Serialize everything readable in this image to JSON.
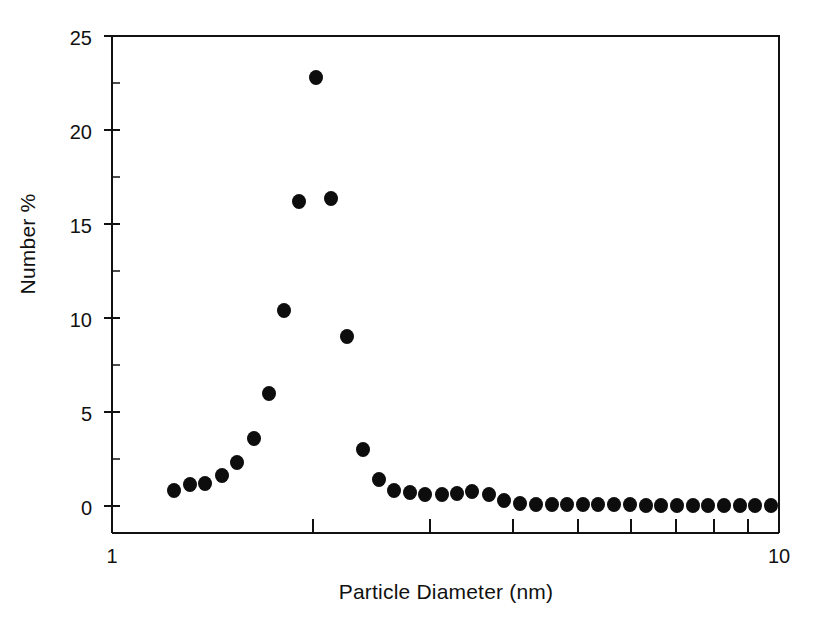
{
  "chart_data": {
    "type": "scatter",
    "title": "",
    "xlabel": "Particle Diameter (nm)",
    "ylabel": "Number %",
    "xscale": "log",
    "yscale": "linear",
    "xlim": [
      1,
      10
    ],
    "ylim": [
      0,
      25
    ],
    "xticks": [
      1,
      10
    ],
    "xtick_labels": [
      "1",
      "10"
    ],
    "yticks": [
      0,
      5,
      10,
      15,
      20,
      25
    ],
    "ytick_labels": [
      "0",
      "5",
      "10",
      "15",
      "20",
      "25"
    ],
    "grid": false,
    "legend": "none",
    "marker": "filled-circle",
    "marker_color": "#0d0d0d",
    "series": [
      {
        "name": "Number %",
        "x": [
          1.24,
          1.31,
          1.38,
          1.46,
          1.54,
          1.63,
          1.72,
          1.81,
          1.91,
          2.02,
          2.13,
          2.25,
          2.38,
          2.51,
          2.65,
          2.8,
          2.95,
          3.12,
          3.29,
          3.47,
          3.67,
          3.87,
          4.09,
          4.32,
          4.56,
          4.81,
          5.08,
          5.36,
          5.66,
          5.97,
          6.31,
          6.66,
          7.03,
          7.42,
          7.83,
          8.27,
          8.73,
          9.21,
          9.72
        ],
        "y": [
          0.85,
          1.15,
          1.2,
          1.6,
          2.3,
          3.6,
          6.0,
          10.4,
          16.2,
          22.8,
          16.35,
          9.0,
          3.0,
          1.4,
          0.85,
          0.7,
          0.6,
          0.6,
          0.65,
          0.75,
          0.6,
          0.3,
          0.12,
          0.1,
          0.08,
          0.08,
          0.07,
          0.07,
          0.06,
          0.06,
          0.05,
          0.05,
          0.05,
          0.04,
          0.04,
          0.04,
          0.03,
          0.03,
          0.03
        ]
      }
    ]
  },
  "axes": {
    "y_axis_title": "Number %",
    "x_axis_title": "Particle Diameter (nm)"
  }
}
